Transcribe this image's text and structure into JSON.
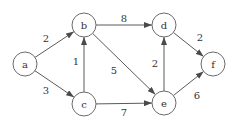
{
  "diagram": {
    "type": "directed-weighted-graph",
    "colors": {
      "background": "#ffffff",
      "node_stroke": "#6b6b6b",
      "edge": "#5a5a5a",
      "text": "#333333"
    },
    "node_radius": 12,
    "nodes": [
      {
        "id": "a",
        "label": "a",
        "x": 25,
        "y": 64
      },
      {
        "id": "b",
        "label": "b",
        "x": 84,
        "y": 25
      },
      {
        "id": "c",
        "label": "c",
        "x": 84,
        "y": 104
      },
      {
        "id": "d",
        "label": "d",
        "x": 164,
        "y": 25
      },
      {
        "id": "e",
        "label": "e",
        "x": 164,
        "y": 103
      },
      {
        "id": "f",
        "label": "f",
        "x": 213,
        "y": 64
      }
    ],
    "edges": [
      {
        "from": "a",
        "to": "b",
        "weight": "2",
        "lx": 46,
        "ly": 38
      },
      {
        "from": "a",
        "to": "c",
        "weight": "3",
        "lx": 46,
        "ly": 90
      },
      {
        "from": "c",
        "to": "b",
        "weight": "1",
        "lx": 76,
        "ly": 61
      },
      {
        "from": "b",
        "to": "d",
        "weight": "8",
        "lx": 124,
        "ly": 18
      },
      {
        "from": "b",
        "to": "e",
        "weight": "5",
        "lx": 114,
        "ly": 70
      },
      {
        "from": "c",
        "to": "e",
        "weight": "7",
        "lx": 124,
        "ly": 112
      },
      {
        "from": "e",
        "to": "d",
        "weight": "2",
        "lx": 155,
        "ly": 63
      },
      {
        "from": "d",
        "to": "f",
        "weight": "2",
        "lx": 200,
        "ly": 37
      },
      {
        "from": "e",
        "to": "f",
        "weight": "6",
        "lx": 197,
        "ly": 95
      }
    ]
  }
}
